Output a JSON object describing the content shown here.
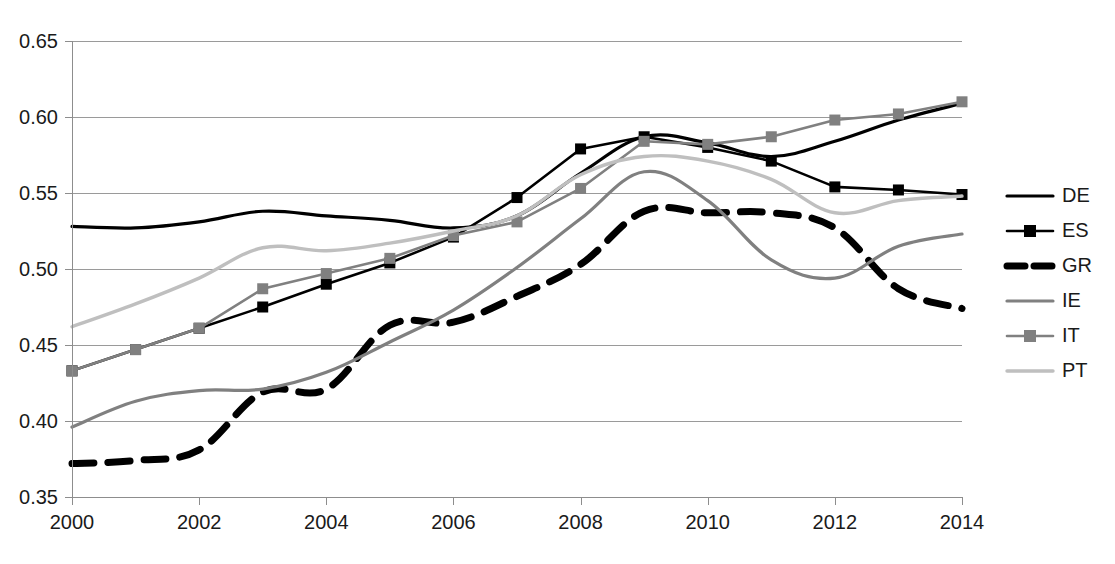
{
  "chart_data": {
    "type": "line",
    "title": "",
    "subtitle": "",
    "xlabel": "",
    "ylabel": "",
    "xlim": [
      2000,
      2014
    ],
    "ylim": [
      0.35,
      0.65
    ],
    "grid": true,
    "legend_position": "right",
    "x": [
      2000,
      2001,
      2002,
      2003,
      2004,
      2005,
      2006,
      2007,
      2008,
      2009,
      2010,
      2011,
      2012,
      2013,
      2014
    ],
    "x_tick_labels": [
      "2000",
      "2002",
      "2004",
      "2006",
      "2008",
      "2010",
      "2012",
      "2014"
    ],
    "x_tick_values": [
      2000,
      2002,
      2004,
      2006,
      2008,
      2010,
      2012,
      2014
    ],
    "y_tick_labels": [
      "0.65",
      "0.60",
      "0.55",
      "0.50",
      "0.45",
      "0.40",
      "0.35"
    ],
    "y_tick_values": [
      0.65,
      0.6,
      0.55,
      0.5,
      0.45,
      0.4,
      0.35
    ],
    "series": [
      {
        "name": "DE",
        "color": "#000000",
        "style": "solid",
        "marker": "none",
        "width": 3.2,
        "values": [
          0.528,
          0.527,
          0.531,
          0.538,
          0.535,
          0.532,
          0.527,
          0.535,
          0.563,
          0.587,
          0.583,
          0.574,
          0.584,
          0.598,
          0.609
        ]
      },
      {
        "name": "ES",
        "color": "#000000",
        "style": "solid",
        "marker": "square",
        "width": 2.6,
        "values": [
          0.433,
          0.447,
          0.461,
          0.475,
          0.49,
          0.504,
          0.521,
          0.547,
          0.579,
          0.587,
          0.58,
          0.571,
          0.554,
          0.552,
          0.549
        ]
      },
      {
        "name": "GR",
        "color": "#000000",
        "style": "dashed",
        "marker": "none",
        "width": 7.0,
        "values": [
          0.372,
          0.374,
          0.381,
          0.419,
          0.421,
          0.463,
          0.465,
          0.482,
          0.503,
          0.538,
          0.537,
          0.537,
          0.527,
          0.487,
          0.474
        ]
      },
      {
        "name": "IE",
        "color": "#808080",
        "style": "solid",
        "marker": "none",
        "width": 3.2,
        "values": [
          0.396,
          0.413,
          0.42,
          0.421,
          0.432,
          0.452,
          0.473,
          0.501,
          0.533,
          0.564,
          0.545,
          0.506,
          0.494,
          0.515,
          0.523
        ]
      },
      {
        "name": "IT",
        "color": "#808080",
        "style": "solid",
        "marker": "square",
        "width": 2.6,
        "values": [
          0.433,
          0.447,
          0.461,
          0.487,
          0.497,
          0.507,
          0.522,
          0.531,
          0.553,
          0.584,
          0.582,
          0.587,
          0.598,
          0.602,
          0.61
        ]
      },
      {
        "name": "PT",
        "color": "#bfbfbf",
        "style": "solid",
        "marker": "none",
        "width": 3.4,
        "values": [
          0.462,
          0.477,
          0.494,
          0.514,
          0.512,
          0.517,
          0.525,
          0.535,
          0.562,
          0.574,
          0.571,
          0.559,
          0.537,
          0.545,
          0.548
        ]
      }
    ],
    "legend": [
      {
        "label": "DE",
        "color": "#000000",
        "style": "solid",
        "marker": "none"
      },
      {
        "label": "ES",
        "color": "#000000",
        "style": "solid",
        "marker": "square"
      },
      {
        "label": "GR",
        "color": "#000000",
        "style": "dashed",
        "marker": "none"
      },
      {
        "label": "IE",
        "color": "#808080",
        "style": "solid",
        "marker": "none"
      },
      {
        "label": "IT",
        "color": "#808080",
        "style": "solid",
        "marker": "square"
      },
      {
        "label": "PT",
        "color": "#bfbfbf",
        "style": "solid",
        "marker": "none"
      }
    ]
  },
  "axes": {
    "gridline_color": "#9a9a9a",
    "axis_color": "#8d8d8d",
    "background": "#ffffff"
  }
}
